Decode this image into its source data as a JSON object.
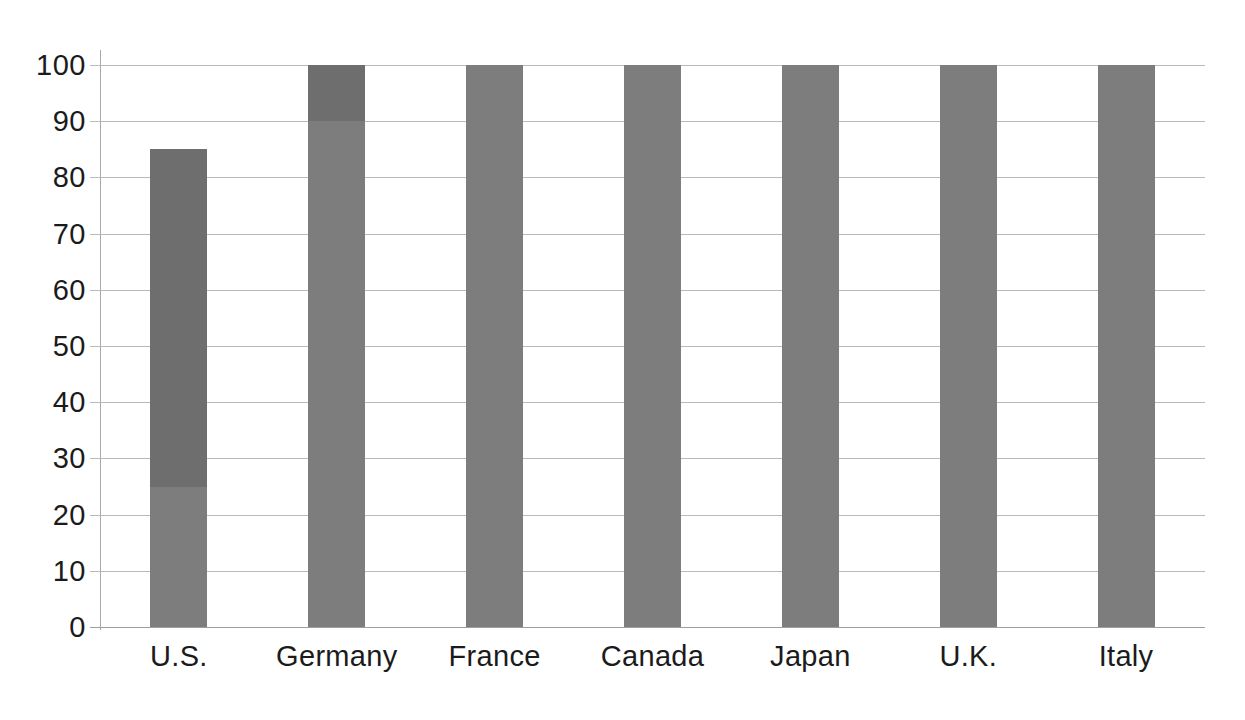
{
  "chart_data": {
    "type": "bar",
    "title": "",
    "subtitle": "",
    "xlabel": "",
    "ylabel": "",
    "categories": [
      "U.S.",
      "Germany",
      "France",
      "Canada",
      "Japan",
      "U.K.",
      "Italy"
    ],
    "values": [
      85,
      100,
      100,
      100,
      100,
      100,
      100
    ],
    "stacked": true,
    "series": [
      {
        "name": "lower-segment",
        "color": "#7d7d7d",
        "values": [
          25,
          90,
          100,
          100,
          100,
          100,
          100
        ]
      },
      {
        "name": "upper-segment",
        "color": "#6e6e6e",
        "values": [
          60,
          10,
          0,
          0,
          0,
          0,
          0
        ]
      }
    ],
    "bar_totals": [
      85,
      100,
      100,
      100,
      100,
      100,
      100
    ],
    "segment_boundaries": [
      25,
      90,
      null,
      null,
      null,
      null,
      null
    ],
    "ylim": [
      0,
      100
    ],
    "yticks": [
      0,
      10,
      20,
      30,
      40,
      50,
      60,
      70,
      80,
      90,
      100
    ],
    "ytick_labels": [
      "0",
      "10",
      "20",
      "30",
      "40",
      "50",
      "60",
      "70",
      "80",
      "90",
      "100"
    ],
    "grid": true,
    "grid_axis": "y",
    "legend": false,
    "legend_position": "none",
    "annotations": []
  },
  "style": {
    "bar_color_light": "#7d7d7d",
    "bar_color_dark": "#6e6e6e",
    "gridline_color": "#b9b9b9",
    "axis_color": "#a8a8a8",
    "baseline_color": "#9e9e9e",
    "text_color": "#1b1b1b",
    "background": "#ffffff"
  }
}
